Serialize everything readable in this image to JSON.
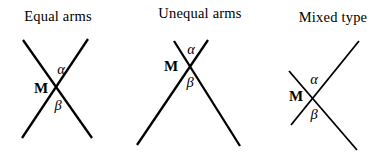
{
  "figure": {
    "background_color": "#ffffff",
    "line_color": "#000000"
  },
  "diagrams": [
    {
      "name": "equal-arms",
      "title": "Equal arms",
      "labels": {
        "vertex": "M",
        "upper_angle": "α",
        "lower_angle": "β"
      },
      "line_width": 2.3,
      "lines": [
        {
          "x1": 23,
          "y1": 40,
          "x2": 92,
          "y2": 138
        },
        {
          "x1": 88,
          "y1": 39,
          "x2": 22,
          "y2": 138
        }
      ]
    },
    {
      "name": "unequal-arms",
      "title": "Unequal arms",
      "labels": {
        "vertex": "M",
        "upper_angle": "α",
        "lower_angle": "β"
      },
      "line_width": 2.3,
      "lines": [
        {
          "x1": 174,
          "y1": 41,
          "x2": 240,
          "y2": 146
        },
        {
          "x1": 208,
          "y1": 40,
          "x2": 137,
          "y2": 145
        }
      ]
    },
    {
      "name": "mixed-type",
      "title": "Mixed type",
      "labels": {
        "vertex": "M",
        "upper_angle": "α",
        "lower_angle": "β"
      },
      "line_width": 1.8,
      "lines": [
        {
          "x1": 359,
          "y1": 41,
          "x2": 291,
          "y2": 125
        },
        {
          "x1": 289,
          "y1": 71,
          "x2": 357,
          "y2": 150
        }
      ]
    }
  ]
}
